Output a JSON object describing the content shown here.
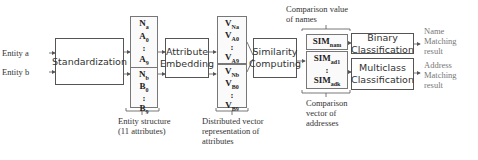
{
  "inputs": {
    "entity_a": "Entity a",
    "entity_b": "Entity b"
  },
  "boxes": {
    "standardization": "Standardization",
    "attribute_embedding": [
      "Attribute",
      "Embedding"
    ],
    "similarity_computing": [
      "Similarity",
      "Computing"
    ],
    "binary_classification": [
      "Binary",
      "Classification"
    ],
    "multiclass_classification": [
      "Multiclass",
      "Classification"
    ]
  },
  "entity_a_attrs": [
    {
      "b": "N",
      "s": "a"
    },
    {
      "b": "A",
      "s": "0"
    },
    {
      "b": ":",
      "s": ""
    },
    {
      "b": "A",
      "s": "9"
    }
  ],
  "entity_b_attrs": [
    {
      "b": "N",
      "s": "b"
    },
    {
      "b": "B",
      "s": "0"
    },
    {
      "b": ":",
      "s": ""
    },
    {
      "b": "B",
      "s": "9"
    }
  ],
  "vectors_a": [
    {
      "b": "V",
      "s": "Na"
    },
    {
      "b": "V",
      "s": "A0"
    },
    {
      "b": ":",
      "s": ""
    },
    {
      "b": "V",
      "s": "A9"
    }
  ],
  "vectors_b": [
    {
      "b": "V",
      "s": "Nb"
    },
    {
      "b": "V",
      "s": "B0"
    },
    {
      "b": ":",
      "s": ""
    },
    {
      "b": "V",
      "s": "B9"
    }
  ],
  "sim_name": {
    "b": "SIM",
    "s": "nam"
  },
  "sim_addr": [
    {
      "b": "SIM",
      "s": "ad1"
    },
    {
      "b": ":",
      "s": ""
    },
    {
      "b": "SIM",
      "s": "adk"
    }
  ],
  "labels": {
    "entity_structure": [
      "Entity structure",
      "(11 attributes)"
    ],
    "distributed_vector": [
      "Distributed vector",
      "representation of",
      "attributes"
    ],
    "comparison_value": [
      "Comparison value",
      "of names"
    ],
    "comparison_vector": [
      "Comparison",
      "vector of",
      "addresses"
    ],
    "name_result": [
      "Name",
      "Matching",
      "result"
    ],
    "address_result": [
      "Address",
      "Matching",
      "result"
    ]
  }
}
